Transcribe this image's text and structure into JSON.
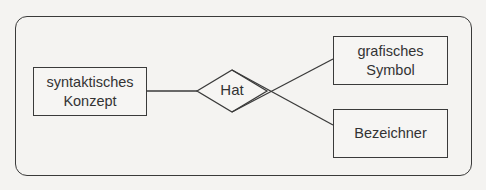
{
  "diagram": {
    "type": "entity-relationship",
    "entities": [
      {
        "id": "syntaktisches-konzept",
        "line1": "syntaktisches",
        "line2": "Konzept"
      },
      {
        "id": "grafisches-symbol",
        "line1": "grafisches",
        "line2": "Symbol"
      },
      {
        "id": "bezeichner",
        "line1": "Bezeichner"
      }
    ],
    "relationship": {
      "label": "Hat"
    },
    "connections": [
      {
        "from": "syntaktisches-konzept",
        "to": "Hat"
      },
      {
        "from": "Hat",
        "to": "grafisches-symbol"
      },
      {
        "from": "Hat",
        "to": "bezeichner"
      }
    ],
    "colors": {
      "stroke": "#3a3a3a",
      "background": "#f4f3f1",
      "text": "#333333"
    }
  }
}
